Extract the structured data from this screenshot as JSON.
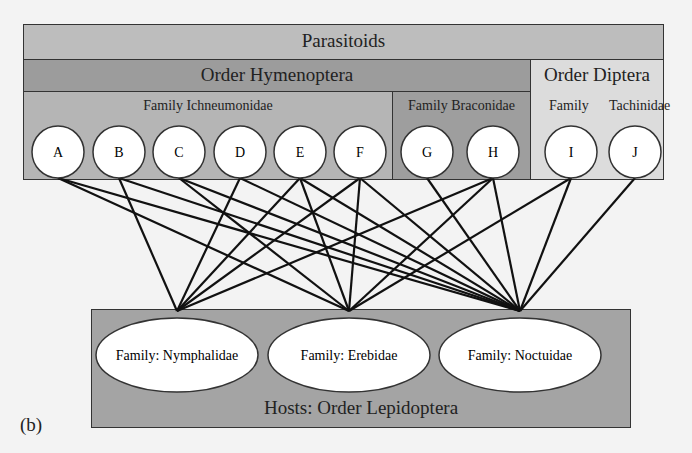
{
  "colors": {
    "background": "#f3f3f3",
    "parasitoids_band": "#bdbdbd",
    "hymenoptera_band": "#9c9c9c",
    "ichneumonidae_panel": "#b5b5b5",
    "braconidae_panel": "#9e9e9e",
    "diptera_panel": "#dcdcdc",
    "hosts_panel": "#a4a4a4",
    "node_fill": "#ffffff",
    "edge": "#111111"
  },
  "parasitoids": {
    "title": "Parasitoids",
    "orders": [
      {
        "label": "Order Hymenoptera",
        "families": [
          {
            "label": "Family Ichneumonidae",
            "nodes": [
              "A",
              "B",
              "C",
              "D",
              "E",
              "F"
            ]
          },
          {
            "label": "Family Braconidae",
            "nodes": [
              "G",
              "H"
            ]
          }
        ]
      },
      {
        "label": "Order Diptera",
        "families": [
          {
            "label_left": "Family",
            "label_right": "Tachinidae",
            "nodes": [
              "I",
              "J"
            ]
          }
        ]
      }
    ]
  },
  "hosts": {
    "title": "Hosts: Order Lepidoptera",
    "families": [
      {
        "id": "nym",
        "label": "Family: Nymphalidae"
      },
      {
        "id": "ere",
        "label": "Family: Erebidae"
      },
      {
        "id": "noc",
        "label": "Family: Noctuidae"
      }
    ]
  },
  "edges": {
    "nym": [
      "B",
      "D",
      "E",
      "F",
      "H"
    ],
    "ere": [
      "A",
      "C",
      "E",
      "F",
      "H",
      "I"
    ],
    "noc": [
      "A",
      "B",
      "C",
      "D",
      "E",
      "F",
      "G",
      "H",
      "I",
      "J"
    ]
  },
  "panel_label": "(b)"
}
